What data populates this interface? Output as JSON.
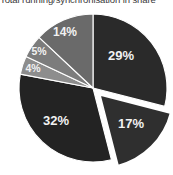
{
  "caption": {
    "text": "Total running/synchronisation in share"
  },
  "chart_data": {
    "type": "pie",
    "title": "Total running/synchronisation in share",
    "xlabel": "",
    "ylabel": "",
    "grid": false,
    "legend": "none",
    "start_angle_deg": 0,
    "direction": "clockwise",
    "labels_inside": true,
    "label_format": "percent",
    "categories": [
      "29%",
      "17%",
      "32%",
      "4%",
      "5%",
      "14%"
    ],
    "values": [
      29,
      17,
      32,
      4,
      5,
      14
    ],
    "slices": [
      {
        "label": "29%",
        "value": 29,
        "color": "#2a2a2a",
        "exploded": false,
        "start_deg": 0,
        "end_deg": 104.4,
        "label_x": 121,
        "label_y": 57
      },
      {
        "label": "17%",
        "value": 17,
        "color": "#2f2f2f",
        "exploded": true,
        "explode_offset": 9,
        "start_deg": 104.4,
        "end_deg": 165.6,
        "label_x": 131,
        "label_y": 125
      },
      {
        "label": "32%",
        "value": 32,
        "color": "#232323",
        "exploded": false,
        "start_deg": 165.6,
        "end_deg": 280.8,
        "label_x": 56,
        "label_y": 122
      },
      {
        "label": "4%",
        "value": 4,
        "color": "#8d8d8d",
        "exploded": false,
        "start_deg": 280.8,
        "end_deg": 295.2,
        "label_x": 33,
        "label_y": 69
      },
      {
        "label": "5%",
        "value": 5,
        "color": "#7c7c7c",
        "exploded": false,
        "start_deg": 295.2,
        "end_deg": 313.2,
        "label_x": 39,
        "label_y": 52
      },
      {
        "label": "14%",
        "value": 14,
        "color": "#6a6a6a",
        "exploded": false,
        "start_deg": 313.2,
        "end_deg": 360,
        "label_x": 65,
        "label_y": 33
      }
    ],
    "geometry": {
      "cx": 93,
      "cy": 88,
      "r": 74
    },
    "colors": {
      "background": "#ffffff",
      "label_text": "#f2f2f2",
      "separator": "#ffffff"
    }
  }
}
